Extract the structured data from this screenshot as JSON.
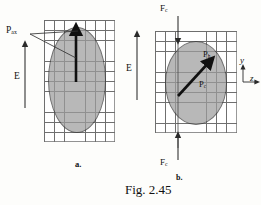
{
  "figure": {
    "caption": "Fig. 2.45",
    "panel_a_label": "a.",
    "panel_b_label": "b."
  },
  "panel_a": {
    "name": "axial-pressure-diagram",
    "grid": {
      "cols": 7,
      "rows": 12,
      "cell_px": 10.2,
      "line_color": "#6f6f6f"
    },
    "shape": {
      "type": "ellipse",
      "fill": "#9d9d9d",
      "stroke": "#3a3a3a"
    },
    "labels": {
      "p_ax": "P",
      "p_ax_sub": "ax",
      "field": "E"
    },
    "vectors": [
      {
        "name": "p-ax-vector",
        "label": "P_ax",
        "direction": "up",
        "origin": "ellipse-center",
        "style": "thick-solid"
      },
      {
        "name": "e-field-vector",
        "label": "E",
        "direction": "up",
        "style": "thin-solid"
      },
      {
        "name": "p-ax-leader",
        "label": "",
        "direction": "diagonal",
        "style": "leader-line"
      }
    ]
  },
  "panel_b": {
    "name": "hoop-and-circumferential-pressure-diagram",
    "grid": {
      "cols": 8,
      "rows": 10,
      "cell_px": 10.2,
      "line_color": "#6f6f6f"
    },
    "shape": {
      "type": "ellipse",
      "fill": "#9d9d9d",
      "stroke": "#3a3a3a"
    },
    "labels": {
      "f_c": "F",
      "f_c_sub": "c",
      "p_h": "P",
      "p_h_sub": "h",
      "p_c": "P",
      "p_c_sub": "c",
      "field": "E",
      "axis_y": "y",
      "axis_z": "z"
    },
    "vectors": [
      {
        "name": "f-c-top-vector",
        "label": "F_c",
        "direction": "down",
        "style": "thin-solid"
      },
      {
        "name": "f-c-bottom-vector",
        "label": "F_c",
        "direction": "up",
        "style": "thin-solid"
      },
      {
        "name": "p-h-vector",
        "label": "P_h",
        "direction": "up-right-diagonal",
        "origin": "ellipse-center",
        "style": "thick-solid"
      },
      {
        "name": "e-field-vector",
        "label": "E",
        "direction": "up",
        "style": "thin-solid"
      }
    ],
    "axes": {
      "name": "coordinate-axes",
      "y_direction": "up",
      "z_direction": "right"
    }
  },
  "colors": {
    "background": "#fdfdfb",
    "grid_line": "#6f6f6f",
    "ellipse_fill": "#9d9d9d",
    "ellipse_stroke": "#3a3a3a",
    "vector": "#111111",
    "text": "#111111"
  }
}
